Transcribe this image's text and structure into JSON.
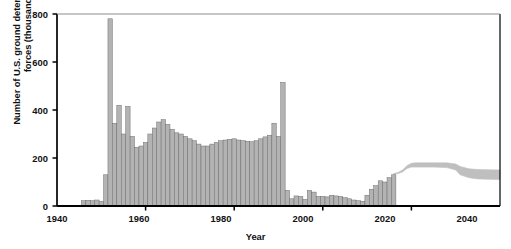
{
  "chart_data": {
    "type": "bar",
    "title": "",
    "xlabel": "Year",
    "ylabel": "Number of U.S. ground deterrence mission forces (thousands)",
    "xlim": [
      1940,
      2040
    ],
    "ylim": [
      0,
      800
    ],
    "xticks": [
      1940,
      1960,
      1980,
      2000,
      2020,
      2040
    ],
    "yticks": [
      0,
      200,
      400,
      600,
      800
    ],
    "xtick_labels": [
      "1940",
      "1960",
      "1980",
      "2000",
      "2020",
      "2040"
    ],
    "ytick_labels": [
      "0",
      "200",
      "400",
      "600",
      "800"
    ],
    "grid": false,
    "legend": null,
    "bar_color": "#b3b3b3",
    "bar_edge_color": "#666666",
    "band_color": "#bfbfbf",
    "axis_color": "#000000",
    "series": [
      {
        "name": "Historical ground deterrence mission forces",
        "type": "bar",
        "x": [
          1946,
          1947,
          1948,
          1949,
          1950,
          1951,
          1952,
          1953,
          1954,
          1955,
          1956,
          1957,
          1958,
          1959,
          1960,
          1961,
          1962,
          1963,
          1964,
          1965,
          1966,
          1967,
          1968,
          1969,
          1970,
          1971,
          1972,
          1973,
          1974,
          1975,
          1976,
          1977,
          1978,
          1979,
          1980,
          1981,
          1982,
          1983,
          1984,
          1985,
          1986,
          1987,
          1988,
          1989,
          1990,
          1991,
          1992,
          1993,
          1994,
          1995,
          1996,
          1997,
          1998,
          1999,
          2000,
          2001,
          2002,
          2003,
          2004,
          2005,
          2006,
          2007,
          2008,
          2009,
          2010,
          2011,
          2012,
          2013,
          2014,
          2015,
          2016
        ],
        "values": [
          22,
          24,
          22,
          25,
          20,
          130,
          780,
          345,
          420,
          300,
          415,
          290,
          245,
          250,
          265,
          300,
          325,
          350,
          360,
          340,
          320,
          305,
          300,
          290,
          280,
          272,
          258,
          250,
          250,
          258,
          265,
          272,
          275,
          278,
          280,
          275,
          272,
          270,
          268,
          272,
          280,
          288,
          295,
          345,
          290,
          515,
          65,
          30,
          42,
          40,
          28,
          65,
          58,
          40,
          40,
          38,
          45,
          42,
          40,
          35,
          30,
          25,
          22,
          20,
          45,
          70,
          85,
          105,
          100,
          118,
          130
        ]
      },
      {
        "name": "Projected force range (upper bound)",
        "type": "band-upper",
        "x": [
          2016,
          2017,
          2018,
          2019,
          2020,
          2021,
          2025,
          2028,
          2030,
          2031,
          2033,
          2035,
          2040
        ],
        "values": [
          135,
          140,
          150,
          168,
          178,
          180,
          180,
          180,
          175,
          165,
          155,
          152,
          150
        ]
      },
      {
        "name": "Projected force range (lower bound)",
        "type": "band-lower",
        "x": [
          2016,
          2017,
          2018,
          2019,
          2020,
          2021,
          2025,
          2028,
          2030,
          2031,
          2033,
          2035,
          2040
        ],
        "values": [
          132,
          135,
          142,
          156,
          162,
          162,
          162,
          160,
          150,
          130,
          118,
          113,
          110
        ]
      }
    ],
    "annotations": []
  }
}
